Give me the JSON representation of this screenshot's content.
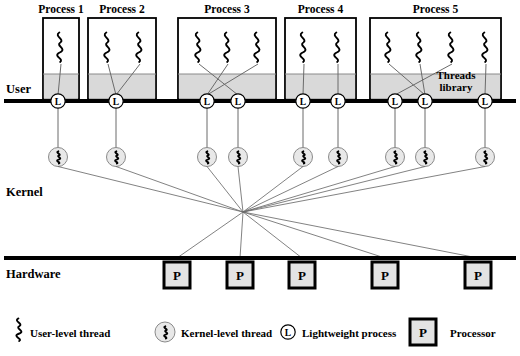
{
  "diagram": {
    "layers": [
      {
        "name": "user",
        "label": "User",
        "x": 6,
        "y": 93
      },
      {
        "name": "kernel",
        "label": "Kernel",
        "x": 6,
        "y": 196
      },
      {
        "name": "hardware",
        "label": "Hardware",
        "x": 6,
        "y": 278
      }
    ],
    "threads_library_label": {
      "line1": "Threads",
      "line2": "library",
      "x": 456,
      "y": 79
    },
    "processes": [
      {
        "label": "Process 1",
        "x": 43,
        "width": 36,
        "user_threads": [
          61
        ],
        "lwps": [
          58
        ]
      },
      {
        "label": "Process 2",
        "x": 88,
        "width": 68,
        "user_threads": [
          108,
          140
        ],
        "lwps": [
          116
        ]
      },
      {
        "label": "Process 3",
        "x": 178,
        "width": 98,
        "user_threads": [
          199,
          228,
          258
        ],
        "lwps": [
          207,
          238
        ]
      },
      {
        "label": "Process 4",
        "x": 285,
        "width": 71,
        "user_threads": [
          304,
          338
        ],
        "lwps": [
          303,
          338
        ]
      },
      {
        "label": "Process 5",
        "x": 370,
        "width": 131,
        "user_threads": [
          389,
          420,
          452,
          486
        ],
        "lwps": [
          395,
          425,
          485
        ]
      }
    ],
    "lwp_glyph": "L",
    "processor_glyph": "P",
    "processors": [
      {
        "label": "P",
        "x": 177
      },
      {
        "label": "P",
        "x": 240
      },
      {
        "label": "P",
        "x": 302
      },
      {
        "label": "P",
        "x": 385
      },
      {
        "label": "P",
        "x": 478
      }
    ],
    "kernel_threads_x": [
      58,
      116,
      207,
      238,
      303,
      338,
      395,
      425,
      485
    ],
    "kernel_converge_point": {
      "x": 243,
      "y": 212
    },
    "legend": [
      {
        "icon": "user-level-thread-icon",
        "label": "User-level thread",
        "x": 18
      },
      {
        "icon": "kernel-level-thread-icon",
        "label": "Kernel-level thread",
        "x": 155
      },
      {
        "icon": "lightweight-process-icon",
        "label": "Lightweight process",
        "x": 280
      },
      {
        "icon": "processor-icon",
        "label": "Processor",
        "x": 410
      }
    ],
    "colors": {
      "line": "#000000",
      "band_fill": "#d9d9d9",
      "circle_fill": "#e8e8e8",
      "connector": "#6b6b6b",
      "box_stroke": "#000000",
      "processor_fill": "#e3e3e3"
    },
    "geometry": {
      "user_line_y": 101,
      "hardware_line_y": 258,
      "box_top": 18,
      "band_top": 74,
      "lwp_circle_y": 101,
      "kernel_circle_y": 157,
      "processor_top": 262,
      "processor_size": 26
    }
  }
}
